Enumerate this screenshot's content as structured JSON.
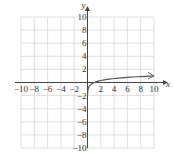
{
  "chart_data": {
    "type": "line",
    "title": "",
    "xlabel": "x",
    "ylabel": "y",
    "xlim": [
      -10,
      10
    ],
    "ylim": [
      -10,
      10
    ],
    "grid": true,
    "x_ticks": [
      -10,
      -8,
      -6,
      -4,
      -2,
      2,
      4,
      6,
      8,
      10
    ],
    "y_ticks": [
      10,
      8,
      6,
      4,
      2,
      -2,
      -4,
      -6,
      -8,
      -10
    ],
    "x_tick_labels": [
      "−10",
      "−8",
      "−6",
      "−4",
      "−2",
      "2",
      "4",
      "6",
      "8",
      "10"
    ],
    "y_tick_labels": [
      "10",
      "8",
      "6",
      "4",
      "2",
      "−2",
      "−4",
      "−6",
      "−8",
      "−10"
    ],
    "series": [
      {
        "name": "y = log x",
        "x": [
          0.01,
          0.05,
          0.1,
          0.3,
          0.5,
          1,
          2,
          3,
          4,
          5,
          6,
          7,
          8,
          9,
          10
        ],
        "values": [
          -2,
          -1.3,
          -1,
          -0.52,
          -0.3,
          0,
          0.3,
          0.48,
          0.6,
          0.7,
          0.78,
          0.85,
          0.9,
          0.95,
          1
        ],
        "color": "#555555",
        "end_arrow": true
      }
    ]
  }
}
